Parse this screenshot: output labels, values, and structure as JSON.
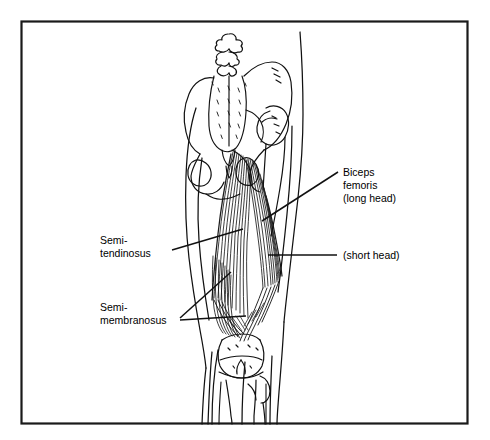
{
  "figure": {
    "frame": {
      "color": "#1a1a1a"
    },
    "ink_color": "#111111",
    "background": "#ffffff"
  },
  "labels": {
    "biceps_femoris": {
      "line1": "Biceps",
      "line2": "femoris",
      "line3": "(long head)"
    },
    "short_head": {
      "line1": "(short head)"
    },
    "semitendinosus": {
      "line1": "Semi-",
      "line2": "tendinosus"
    },
    "semimembranosus": {
      "line1": "Semi-",
      "line2": "membranosus"
    }
  },
  "structures": {
    "sacrum": "sacrum",
    "ilium": "ilium",
    "femur": "femur",
    "knee": "knee-joint",
    "tibia": "tibia",
    "fibula": "fibula"
  }
}
